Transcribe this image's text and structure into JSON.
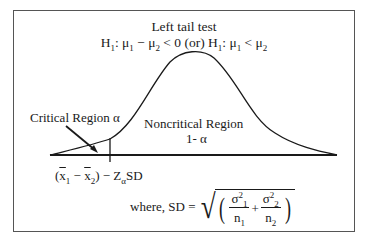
{
  "diagram": {
    "title": "Left tail test",
    "hypothesis": {
      "h1": "H",
      "h1_sub": "1",
      "colon": ": ",
      "mu": "μ",
      "sub1": "1",
      "sub2": "2",
      "minus": " − ",
      "lt_zero": " < 0 (or) ",
      "lt": " < "
    },
    "critical_region_label": "Critical Region α",
    "noncritical_region_label": "Noncritical Region",
    "noncritical_region_value": "1- α",
    "critical_value_expr": {
      "open": "(",
      "x": "x",
      "sub1": "1",
      "minus": " − ",
      "sub2": "2",
      "close": ")",
      "z_part": " − Z",
      "z_sub": "α",
      "sd": "SD"
    },
    "sd_formula": {
      "prefix": "where, SD = ",
      "sigma": "σ",
      "sq": "2",
      "sub1": "1",
      "sub2": "2",
      "n": "n",
      "plus": "+",
      "lparen": "(",
      "rparen": ")",
      "radical": "√"
    },
    "colors": {
      "stroke": "#1a1a1a",
      "frame": "#555555",
      "background": "#ffffff"
    }
  }
}
